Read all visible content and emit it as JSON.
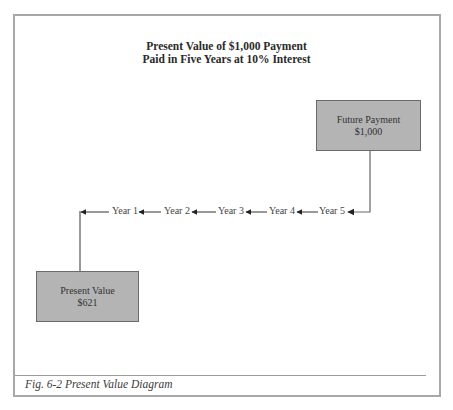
{
  "diagram": {
    "title_line1": "Present Value of $1,000 Payment",
    "title_line2": "Paid in Five Years at 10% Interest",
    "future_box": {
      "label": "Future Payment",
      "value": "$1,000"
    },
    "present_box": {
      "label": "Present Value",
      "value": "$621"
    },
    "timeline": [
      {
        "label": "Year 1"
      },
      {
        "label": "Year 2"
      },
      {
        "label": "Year 3"
      },
      {
        "label": "Year 4"
      },
      {
        "label": "Year 5"
      }
    ],
    "colors": {
      "box_fill": "#b4b4b4",
      "frame_border": "#a8a8a8",
      "connector": "#666666"
    }
  },
  "caption": {
    "text": "Fig. 6-2 Present Value Diagram"
  }
}
